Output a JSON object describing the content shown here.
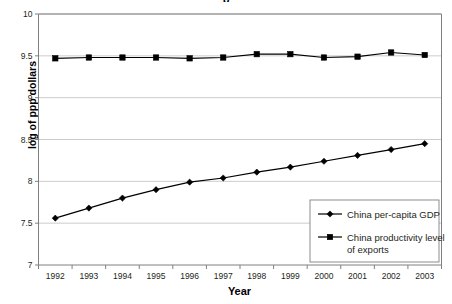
{
  "chart_data": {
    "type": "line",
    "title": "p",
    "xlabel": "Year",
    "ylabel": "log of ppp dollars",
    "categories": [
      "1992",
      "1993",
      "1994",
      "1995",
      "1996",
      "1997",
      "1998",
      "1999",
      "2000",
      "2001",
      "2002",
      "2003"
    ],
    "ylim": [
      7,
      10
    ],
    "yticks": [
      "7",
      "7.5",
      "8",
      "8.5",
      "9",
      "9.5",
      "10"
    ],
    "ytick_values": [
      7,
      7.5,
      8,
      8.5,
      9,
      9.5,
      10
    ],
    "grid": true,
    "legend_position": "bottom-right",
    "series": [
      {
        "name": "China per-capita GDP",
        "marker": "diamond",
        "values": [
          7.56,
          7.68,
          7.8,
          7.9,
          7.99,
          8.04,
          8.11,
          8.17,
          8.24,
          8.31,
          8.38,
          8.45
        ]
      },
      {
        "name": "China productivity level\nof exports",
        "marker": "square",
        "values": [
          9.47,
          9.48,
          9.48,
          9.48,
          9.47,
          9.48,
          9.52,
          9.52,
          9.48,
          9.49,
          9.54,
          9.51
        ]
      }
    ]
  },
  "legend": {
    "entries": [
      {
        "label": "China per-capita GDP",
        "marker": "diamond"
      },
      {
        "label_line1": "China productivity level",
        "label_line2": "of exports",
        "marker": "square"
      }
    ]
  },
  "colors": {
    "series": "#000000",
    "grid": "#bfbfbf",
    "axis": "#808080",
    "text": "#231f20",
    "background": "#ffffff"
  }
}
